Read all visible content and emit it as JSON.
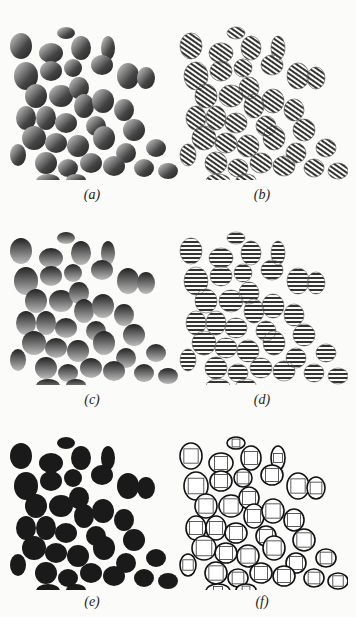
{
  "figure": {
    "panels": [
      {
        "id": "a",
        "caption": "(a)",
        "description": "Original grayscale image of shaded elliptical particles"
      },
      {
        "id": "b",
        "caption": "(b)",
        "description": "Particles rendered with curved striped contour pattern"
      },
      {
        "id": "c",
        "caption": "(c)",
        "description": "Grayscale particles with vertical shading gradient"
      },
      {
        "id": "d",
        "caption": "(d)",
        "description": "Particles rendered with horizontal stripe pattern"
      },
      {
        "id": "e",
        "caption": "(e)",
        "description": "Segmented particles filled solid dark"
      },
      {
        "id": "f",
        "caption": "(f)",
        "description": "Particle outlines with square interior regions"
      }
    ]
  },
  "style": {
    "dark": "#1a1a1a",
    "mid": "#555555",
    "background": "#fbfbf9"
  }
}
